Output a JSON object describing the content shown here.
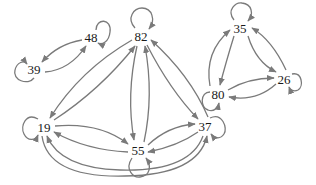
{
  "diagram": {
    "type": "directed-graph",
    "colors": {
      "background": "#ffffff",
      "edge": "#7a7a7a",
      "text": "#1a1a1a"
    },
    "nodes": [
      {
        "id": "n48",
        "label": "48",
        "x": 91,
        "y": 37,
        "self_loop": "upper-right"
      },
      {
        "id": "n39",
        "label": "39",
        "x": 34,
        "y": 69,
        "self_loop": "left"
      },
      {
        "id": "n82",
        "label": "82",
        "x": 141,
        "y": 36,
        "self_loop": "top"
      },
      {
        "id": "n35",
        "label": "35",
        "x": 240,
        "y": 28,
        "self_loop": "top"
      },
      {
        "id": "n26",
        "label": "26",
        "x": 284,
        "y": 79,
        "self_loop": "right"
      },
      {
        "id": "n80",
        "label": "80",
        "x": 218,
        "y": 94,
        "self_loop": "left"
      },
      {
        "id": "n19",
        "label": "19",
        "x": 44,
        "y": 127,
        "self_loop": "left"
      },
      {
        "id": "n55",
        "label": "55",
        "x": 138,
        "y": 150,
        "self_loop": "bottom"
      },
      {
        "id": "n37",
        "label": "37",
        "x": 205,
        "y": 126,
        "self_loop": "right"
      }
    ],
    "edges": [
      {
        "from": "48",
        "to": "39"
      },
      {
        "from": "39",
        "to": "48"
      },
      {
        "from": "82",
        "to": "19"
      },
      {
        "from": "19",
        "to": "82"
      },
      {
        "from": "82",
        "to": "55"
      },
      {
        "from": "55",
        "to": "82"
      },
      {
        "from": "82",
        "to": "37"
      },
      {
        "from": "37",
        "to": "82"
      },
      {
        "from": "19",
        "to": "55"
      },
      {
        "from": "55",
        "to": "19"
      },
      {
        "from": "55",
        "to": "37"
      },
      {
        "from": "37",
        "to": "55"
      },
      {
        "from": "19",
        "to": "37"
      },
      {
        "from": "37",
        "to": "19"
      },
      {
        "from": "35",
        "to": "80"
      },
      {
        "from": "80",
        "to": "35"
      },
      {
        "from": "35",
        "to": "26"
      },
      {
        "from": "26",
        "to": "35"
      },
      {
        "from": "80",
        "to": "26"
      },
      {
        "from": "26",
        "to": "80"
      },
      {
        "from": "48",
        "to": "48"
      },
      {
        "from": "39",
        "to": "39"
      },
      {
        "from": "82",
        "to": "82"
      },
      {
        "from": "35",
        "to": "35"
      },
      {
        "from": "26",
        "to": "26"
      },
      {
        "from": "80",
        "to": "80"
      },
      {
        "from": "19",
        "to": "19"
      },
      {
        "from": "55",
        "to": "55"
      },
      {
        "from": "37",
        "to": "37"
      }
    ]
  }
}
